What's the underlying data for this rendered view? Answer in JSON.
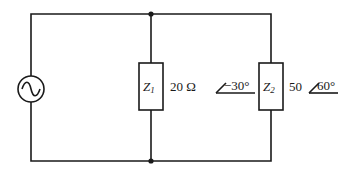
{
  "diagram": {
    "type": "parallel AC circuit",
    "source": {
      "symbol": "ac-voltage-source"
    },
    "branches": [
      {
        "id": "Z1",
        "label_main": "Z",
        "label_sub": "1",
        "magnitude": "20 Ω",
        "angle": "−30°"
      },
      {
        "id": "Z2",
        "label_main": "Z",
        "label_sub": "2",
        "magnitude": "50",
        "angle": "60°"
      }
    ],
    "nodes": [
      "top-junction",
      "bottom-junction"
    ]
  }
}
